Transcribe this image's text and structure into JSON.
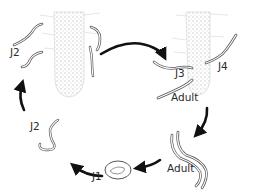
{
  "diagram": {
    "type": "life-cycle",
    "stages": [
      {
        "id": "j2-infective",
        "label": "J2",
        "position": "top-left, near root"
      },
      {
        "id": "j3",
        "label": "J3",
        "position": "top-right root"
      },
      {
        "id": "j4",
        "label": "J4",
        "position": "top-right root"
      },
      {
        "id": "adult-in-root",
        "label": "Adult",
        "position": "top-right root tip"
      },
      {
        "id": "adult-free",
        "label": "Adult",
        "position": "bottom-right"
      },
      {
        "id": "j1",
        "label": "J1",
        "position": "bottom-center, egg"
      },
      {
        "id": "j2-hatched",
        "label": "J2",
        "position": "left, hatching"
      }
    ],
    "arrows": [
      {
        "from": "j2-infective",
        "to": "j3"
      },
      {
        "from": "adult-in-root",
        "to": "adult-free"
      },
      {
        "from": "adult-free",
        "to": "j1"
      },
      {
        "from": "j1",
        "to": "j2-hatched"
      },
      {
        "from": "j2-hatched",
        "to": "j2-infective"
      }
    ],
    "colors": {
      "arrow": "#111111",
      "root": "#b8b8b8",
      "worm_outline": "#555555",
      "text": "#2a2a2a"
    }
  },
  "labels": {
    "j2_top": "J2",
    "j3": "J3",
    "j4": "J4",
    "adult_root": "Adult",
    "adult_bottom": "Adult",
    "j1": "J1",
    "j2_left": "J2"
  }
}
